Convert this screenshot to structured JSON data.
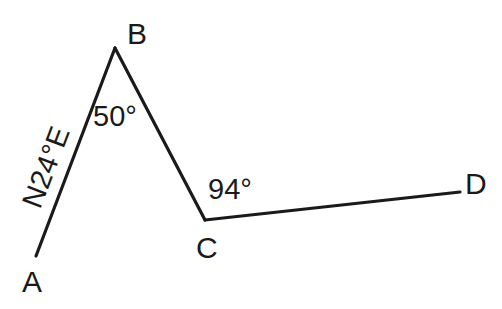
{
  "diagram": {
    "type": "traverse",
    "points": [
      {
        "id": "A",
        "label": "A"
      },
      {
        "id": "B",
        "label": "B"
      },
      {
        "id": "C",
        "label": "C"
      },
      {
        "id": "D",
        "label": "D"
      }
    ],
    "segments": [
      {
        "from": "A",
        "to": "B"
      },
      {
        "from": "B",
        "to": "C"
      },
      {
        "from": "C",
        "to": "D"
      }
    ],
    "annotations": {
      "bearing_AB": "N24°E",
      "angle_B": "50°",
      "angle_C": "94°"
    },
    "line_color": "#1a1a1a",
    "background": "#ffffff"
  }
}
